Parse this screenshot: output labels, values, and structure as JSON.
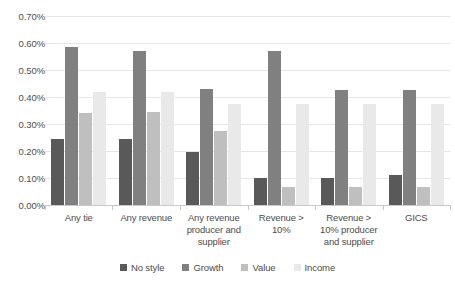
{
  "chart_data": {
    "type": "bar",
    "title": "",
    "xlabel": "",
    "ylabel": "",
    "ylim": [
      0,
      0.007
    ],
    "ytick_labels": [
      "0.70%",
      "0.60%",
      "0.50%",
      "0.40%",
      "0.30%",
      "0.20%",
      "0.10%",
      "0.00%"
    ],
    "ytick_values": [
      0.7,
      0.6,
      0.5,
      0.4,
      0.3,
      0.2,
      0.1,
      0.0
    ],
    "value_unit": "percent",
    "grid": true,
    "legend_position": "bottom",
    "categories": [
      "Any tie",
      "Any revenue",
      "Any revenue producer and supplier",
      "Revenue > 10%",
      "Revenue > 10% producer and supplier",
      "GICS"
    ],
    "category_labels": [
      "Any tie",
      "Any revenue",
      "Any revenue producer and supplier",
      "Revenue > 10%",
      "Revenue > 10% producer and supplier",
      "GICS"
    ],
    "series": [
      {
        "name": "No style",
        "color": "#595959",
        "values": [
          0.245,
          0.245,
          0.195,
          0.1,
          0.1,
          0.11
        ]
      },
      {
        "name": "Growth",
        "color": "#808080",
        "values": [
          0.585,
          0.57,
          0.43,
          0.57,
          0.425,
          0.425
        ]
      },
      {
        "name": "Value",
        "color": "#bfbfbf",
        "values": [
          0.34,
          0.345,
          0.275,
          0.065,
          0.065,
          0.065
        ]
      },
      {
        "name": "Income",
        "color": "#e9e9e9",
        "values": [
          0.42,
          0.42,
          0.375,
          0.375,
          0.375,
          0.375
        ]
      }
    ]
  },
  "legend": {
    "items": [
      {
        "label": "No style"
      },
      {
        "label": "Growth"
      },
      {
        "label": "Value"
      },
      {
        "label": "Income"
      }
    ]
  }
}
